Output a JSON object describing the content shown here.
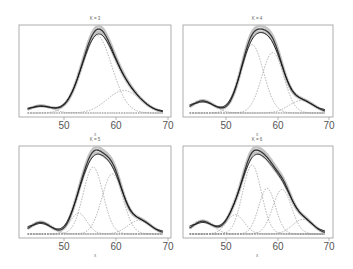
{
  "figure": {
    "layout": "2x2",
    "panels": [
      {
        "title": "K = 3",
        "xlabel": "x",
        "xticks": [
          "50",
          "60",
          "70"
        ]
      },
      {
        "title": "K = 4",
        "xlabel": "x",
        "xticks": [
          "50",
          "60",
          "70"
        ]
      },
      {
        "title": "K = 5",
        "xlabel": "x",
        "xticks": [
          "50",
          "60",
          "70"
        ]
      },
      {
        "title": "K = 6",
        "xlabel": "x",
        "xticks": [
          "50",
          "60",
          "70"
        ]
      }
    ]
  },
  "colors": {
    "fit": "#333333",
    "band": "#c4c4c4",
    "components": "#8a8a8a",
    "frame": "#9a9a9a"
  },
  "chart_data": [
    {
      "type": "line",
      "title": "K = 3",
      "xlabel": "x",
      "ylabel": "",
      "xlim": [
        43,
        69
      ],
      "xticks": [
        50,
        60,
        70
      ],
      "grid": false,
      "series": [
        {
          "name": "mixture fit",
          "components": [
            {
              "weight": 0.05,
              "mean": 45.5,
              "sd": 2.2
            },
            {
              "weight": 0.72,
              "mean": 56.3,
              "sd": 2.9
            },
            {
              "weight": 0.23,
              "mean": 61.5,
              "sd": 3.2
            }
          ]
        },
        {
          "name": "kernel density estimate",
          "style": "solid dark"
        },
        {
          "name": "posterior band",
          "style": "grey band"
        }
      ]
    },
    {
      "type": "line",
      "title": "K = 4",
      "xlabel": "x",
      "ylabel": "",
      "xlim": [
        43,
        69
      ],
      "xticks": [
        50,
        60,
        70
      ],
      "grid": false,
      "series": [
        {
          "name": "mixture fit",
          "components": [
            {
              "weight": 0.08,
              "mean": 45.5,
              "sd": 2.2
            },
            {
              "weight": 0.45,
              "mean": 55.0,
              "sd": 2.2
            },
            {
              "weight": 0.38,
              "mean": 59.0,
              "sd": 2.1
            },
            {
              "weight": 0.09,
              "mean": 64.5,
              "sd": 2.4
            }
          ]
        },
        {
          "name": "kernel density estimate",
          "style": "solid dark"
        },
        {
          "name": "posterior band",
          "style": "grey band"
        }
      ]
    },
    {
      "type": "line",
      "title": "K = 5",
      "xlabel": "x",
      "ylabel": "",
      "xlim": [
        43,
        69
      ],
      "xticks": [
        50,
        60,
        70
      ],
      "grid": false,
      "series": [
        {
          "name": "mixture fit",
          "components": [
            {
              "weight": 0.07,
              "mean": 45.5,
              "sd": 2.0
            },
            {
              "weight": 0.1,
              "mean": 52.8,
              "sd": 1.6
            },
            {
              "weight": 0.38,
              "mean": 55.6,
              "sd": 1.9
            },
            {
              "weight": 0.36,
              "mean": 59.3,
              "sd": 2.0
            },
            {
              "weight": 0.09,
              "mean": 64.5,
              "sd": 2.2
            }
          ]
        },
        {
          "name": "kernel density estimate",
          "style": "solid dark"
        },
        {
          "name": "posterior band",
          "style": "grey band"
        }
      ]
    },
    {
      "type": "line",
      "title": "K = 6",
      "xlabel": "x",
      "ylabel": "",
      "xlim": [
        43,
        69
      ],
      "xticks": [
        50,
        60,
        70
      ],
      "grid": false,
      "series": [
        {
          "name": "mixture fit",
          "components": [
            {
              "weight": 0.07,
              "mean": 45.5,
              "sd": 2.0
            },
            {
              "weight": 0.09,
              "mean": 51.8,
              "sd": 1.7
            },
            {
              "weight": 0.34,
              "mean": 55.0,
              "sd": 1.8
            },
            {
              "weight": 0.2,
              "mean": 57.9,
              "sd": 1.6
            },
            {
              "weight": 0.22,
              "mean": 60.8,
              "sd": 1.8
            },
            {
              "weight": 0.08,
              "mean": 64.8,
              "sd": 2.0
            }
          ]
        },
        {
          "name": "kernel density estimate",
          "style": "solid dark"
        },
        {
          "name": "posterior band",
          "style": "grey band"
        }
      ]
    }
  ]
}
